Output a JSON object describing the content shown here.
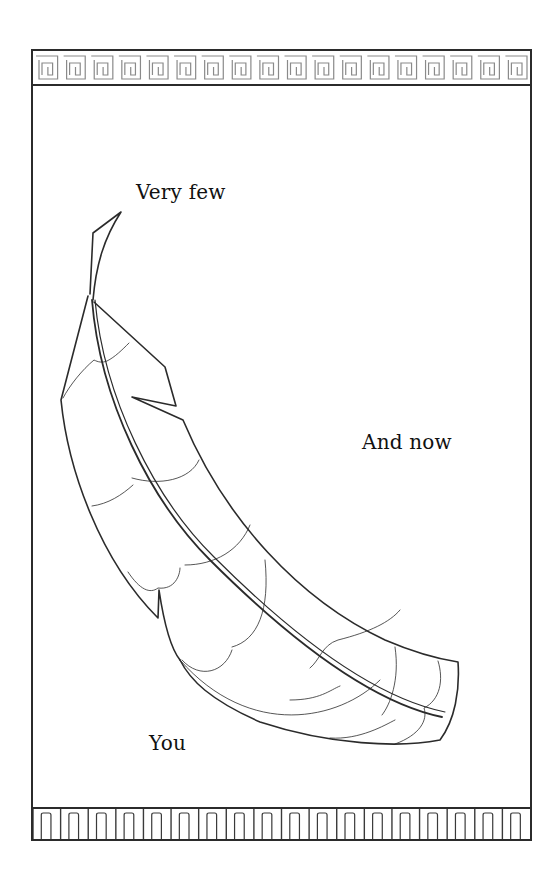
{
  "page": {
    "background": "#ffffff",
    "line_color": "#2b2b2b"
  },
  "labels": {
    "top": "Very few",
    "right": "And now",
    "bottom": "You"
  },
  "decorations": {
    "top_border": "greek-key-pattern",
    "bottom_border": "comb-pattern",
    "illustration": "feather-outline"
  }
}
